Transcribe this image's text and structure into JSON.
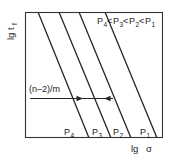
{
  "figure": {
    "name": "log-log fatigue-life diagram",
    "background_color": "#ffffff",
    "line_color": "#222222",
    "text_color": "#1a1a1a",
    "frame": {
      "x": 25,
      "y": 12,
      "width": 138,
      "height": 126,
      "stroke_width": 1.1
    }
  },
  "axes": {
    "y_label_main": "lg t",
    "y_label_sub": "f",
    "x_label_main": "lg",
    "x_label_sub": "σ",
    "x_label_full": "lg σ",
    "y_label_full": "lg t_f",
    "ticks": [],
    "grid": false
  },
  "legend": {
    "text": "P4<P3<P2<P1",
    "parts": [
      {
        "base": "P",
        "sub": "4"
      },
      {
        "op": "<"
      },
      {
        "base": "P",
        "sub": "3"
      },
      {
        "op": "<"
      },
      {
        "base": "P",
        "sub": "2"
      },
      {
        "op": "<"
      },
      {
        "base": "P",
        "sub": "1"
      }
    ],
    "position": "top-right-inside"
  },
  "annotation": {
    "label_main": "(n–2)/m",
    "arrow": {
      "type": "double-headed-horizontal",
      "x_start": 30,
      "x_end": 113,
      "y": 98
    }
  },
  "chart_data": {
    "type": "line",
    "title": "",
    "subtitle": "",
    "xlabel": "lg σ",
    "ylabel": "lg t_f",
    "xlim": [
      0,
      1
    ],
    "ylim": [
      0,
      1
    ],
    "grid": false,
    "legend_position": "top-right",
    "annotations": [
      {
        "text": "(n–2)/m",
        "x": 0.05,
        "y": 0.33,
        "arrow": "double-headed"
      },
      {
        "text": "P4<P3<P2<P1",
        "x": 0.55,
        "y": 0.95
      }
    ],
    "series": [
      {
        "name": "P4",
        "label": "P₄",
        "label_base": "P",
        "label_sub": "4",
        "x": [
          0.093,
          0.464
        ],
        "y": [
          1.0,
          0.0
        ],
        "x_top_px": 38,
        "x_bottom_px": 89,
        "label_x_px": 69,
        "label_y_px": 136
      },
      {
        "name": "P3",
        "label": "P₃",
        "label_base": "P",
        "label_sub": "3",
        "x": [
          0.246,
          0.623
        ],
        "y": [
          1.0,
          0.0
        ],
        "x_top_px": 59,
        "x_bottom_px": 111,
        "label_x_px": 97,
        "label_y_px": 136
      },
      {
        "name": "P2",
        "label": "P₂",
        "label_base": "P",
        "label_sub": "2",
        "x": [
          0.391,
          0.768
        ],
        "y": [
          1.0,
          0.0
        ],
        "x_top_px": 79,
        "x_bottom_px": 131,
        "label_x_px": 118,
        "label_y_px": 136
      },
      {
        "name": "P1",
        "label": "P₁",
        "label_base": "P",
        "label_sub": "1",
        "x": [
          0.58,
          0.957
        ],
        "y": [
          1.0,
          0.0
        ],
        "x_top_px": 105,
        "x_bottom_px": 157,
        "label_x_px": 145,
        "label_y_px": 136
      }
    ]
  }
}
